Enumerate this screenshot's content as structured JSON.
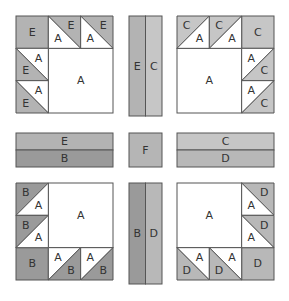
{
  "diagram": {
    "type": "quilt-block-assembly",
    "fabrics": {
      "A": "#ffffff",
      "B": "#9a9a9a",
      "C": "#c6c6c6",
      "D": "#b8b8b8",
      "E": "#b3b3b3",
      "F": "#b5b5b5"
    },
    "stroke": "#555555",
    "corner_blocks": [
      {
        "name": "top-left",
        "x": 16,
        "y": 16,
        "size": 97,
        "big_square": "A",
        "big_square_pos": "bottom-right",
        "corner_square": {
          "pos": [
            0,
            0
          ],
          "label": "E"
        },
        "hst": [
          {
            "pos": [
              1,
              0
            ],
            "diag": "tl-br",
            "upper": "E",
            "lower": "A"
          },
          {
            "pos": [
              2,
              0
            ],
            "diag": "tl-br",
            "upper": "E",
            "lower": "A"
          },
          {
            "pos": [
              0,
              1
            ],
            "diag": "tl-br",
            "upper": "A",
            "lower": "E"
          },
          {
            "pos": [
              0,
              2
            ],
            "diag": "tl-br",
            "upper": "A",
            "lower": "E"
          }
        ]
      },
      {
        "name": "top-right",
        "x": 177,
        "y": 16,
        "size": 97,
        "big_square": "A",
        "big_square_pos": "bottom-left",
        "corner_square": {
          "pos": [
            2,
            0
          ],
          "label": "C"
        },
        "hst": [
          {
            "pos": [
              0,
              0
            ],
            "diag": "bl-tr",
            "upper": "C",
            "lower": "A"
          },
          {
            "pos": [
              1,
              0
            ],
            "diag": "bl-tr",
            "upper": "C",
            "lower": "A"
          },
          {
            "pos": [
              2,
              1
            ],
            "diag": "bl-tr",
            "upper": "A",
            "lower": "C"
          },
          {
            "pos": [
              2,
              2
            ],
            "diag": "bl-tr",
            "upper": "A",
            "lower": "C"
          }
        ]
      },
      {
        "name": "bottom-left",
        "x": 16,
        "y": 183,
        "size": 97,
        "big_square": "A",
        "big_square_pos": "top-right",
        "corner_square": {
          "pos": [
            0,
            2
          ],
          "label": "B"
        },
        "hst": [
          {
            "pos": [
              0,
              0
            ],
            "diag": "bl-tr",
            "upper": "B",
            "lower": "A"
          },
          {
            "pos": [
              0,
              1
            ],
            "diag": "bl-tr",
            "upper": "B",
            "lower": "A"
          },
          {
            "pos": [
              1,
              2
            ],
            "diag": "bl-tr",
            "upper": "A",
            "lower": "B"
          },
          {
            "pos": [
              2,
              2
            ],
            "diag": "bl-tr",
            "upper": "A",
            "lower": "B"
          }
        ]
      },
      {
        "name": "bottom-right",
        "x": 177,
        "y": 183,
        "size": 97,
        "big_square": "A",
        "big_square_pos": "top-left",
        "corner_square": {
          "pos": [
            2,
            2
          ],
          "label": "D"
        },
        "hst": [
          {
            "pos": [
              2,
              0
            ],
            "diag": "tl-br",
            "upper": "D",
            "lower": "A"
          },
          {
            "pos": [
              2,
              1
            ],
            "diag": "tl-br",
            "upper": "D",
            "lower": "A"
          },
          {
            "pos": [
              0,
              2
            ],
            "diag": "tl-br",
            "upper": "A",
            "lower": "D"
          },
          {
            "pos": [
              1,
              2
            ],
            "diag": "tl-br",
            "upper": "A",
            "lower": "D"
          }
        ]
      }
    ],
    "sashing": [
      {
        "name": "top-vertical-strip",
        "x": 129,
        "y": 16,
        "w": 33,
        "h": 100,
        "orientation": "vertical",
        "parts": [
          "E",
          "C"
        ]
      },
      {
        "name": "left-horizontal-strip",
        "x": 16,
        "y": 133,
        "w": 97,
        "h": 34,
        "orientation": "horizontal",
        "parts": [
          "E",
          "B"
        ]
      },
      {
        "name": "center-square",
        "x": 129,
        "y": 133,
        "w": 33,
        "h": 34,
        "orientation": "single",
        "parts": [
          "F"
        ]
      },
      {
        "name": "right-horizontal-strip",
        "x": 177,
        "y": 133,
        "w": 97,
        "h": 34,
        "orientation": "horizontal",
        "parts": [
          "C",
          "D"
        ]
      },
      {
        "name": "bottom-vertical-strip",
        "x": 129,
        "y": 183,
        "w": 33,
        "h": 101,
        "orientation": "vertical",
        "parts": [
          "B",
          "D"
        ]
      }
    ]
  }
}
